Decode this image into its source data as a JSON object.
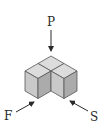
{
  "diagram": {
    "type": "isometric-views",
    "labels": {
      "plan": "P",
      "front": "F",
      "side": "S"
    },
    "colors": {
      "top_face": "#dcdcdc",
      "left_face": "#c9c9c9",
      "right_face": "#ababab",
      "edge": "#555555",
      "arrow": "#2a2a2a"
    },
    "cubes": [
      {
        "name": "back-cube"
      },
      {
        "name": "front-left-cube"
      },
      {
        "name": "front-right-cube"
      }
    ]
  }
}
